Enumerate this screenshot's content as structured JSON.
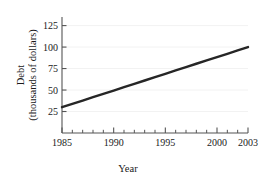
{
  "chart_data": {
    "type": "line",
    "title": "",
    "subtitle": "",
    "xlabel": "Year",
    "ylabel_line1": "Debt",
    "ylabel_line2": "(thousands of dollars)",
    "xlim": [
      1985,
      2003
    ],
    "ylim": [
      0,
      135
    ],
    "grid": true,
    "grid_axis": "y",
    "legend": "none",
    "x_tick_labels": [
      "1985",
      "1990",
      "1995",
      "2000",
      "2003"
    ],
    "x_tick_values": [
      1985,
      1990,
      1995,
      2000,
      2003
    ],
    "x_minor_ticks": [
      1986,
      1987,
      1988,
      1989,
      1991,
      1992,
      1993,
      1994,
      1996,
      1997,
      1998,
      1999,
      2001,
      2002
    ],
    "y_tick_labels": [
      "25",
      "50",
      "75",
      "100",
      "125"
    ],
    "y_tick_values": [
      25,
      50,
      75,
      100,
      125
    ],
    "series": [
      {
        "name": "Debt",
        "color": "#262626",
        "x": [
          1985,
          1986,
          1987,
          1988,
          1989,
          1990,
          1991,
          1992,
          1993,
          1994,
          1995,
          1996,
          1997,
          1998,
          1999,
          2000,
          2001,
          2002,
          2003
        ],
        "values": [
          30.0,
          33.9,
          37.8,
          41.7,
          45.6,
          49.4,
          53.3,
          57.2,
          61.1,
          65.0,
          68.9,
          72.8,
          76.7,
          80.6,
          84.4,
          88.3,
          92.2,
          96.1,
          100.0
        ]
      }
    ],
    "axis_color": "#555555",
    "grid_color": "#f2f2f2",
    "background": "#ffffff"
  }
}
